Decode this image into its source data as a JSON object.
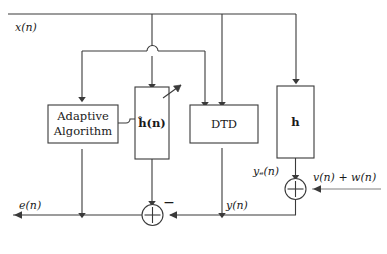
{
  "figure": {
    "type": "block-diagram",
    "background_color": "#ffffff",
    "line_color": "#3a3a3a"
  },
  "blocks": [
    {
      "id": "adaptive",
      "label_line1": "Adaptive",
      "label_line2": "Algorithm",
      "bold": false
    },
    {
      "id": "hhat",
      "label": "ĥ(n)",
      "bold": true
    },
    {
      "id": "dtd",
      "label": "DTD",
      "bold": false
    },
    {
      "id": "h",
      "label": "h",
      "bold": true
    }
  ],
  "signals": {
    "input": "x(n)",
    "error": "e(n)",
    "echo_estimate_out": "y(n)",
    "echo": "yₑ(n)",
    "noise": "v(n) + w(n)"
  },
  "junctions": [
    {
      "id": "sum-top",
      "symbol": "+",
      "sign_label": ""
    },
    {
      "id": "sum-bottom",
      "symbol": "+",
      "sign_label": "−"
    }
  ],
  "annotations": {
    "minus_sign": "−",
    "adaptive_arrow": "diagonal-arrow"
  }
}
